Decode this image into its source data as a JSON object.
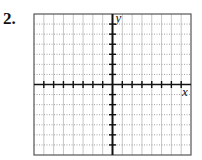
{
  "problem": {
    "number": "2."
  },
  "graph": {
    "x_label": "x",
    "y_label": "y",
    "columns": 16,
    "rows": 14,
    "origin_col": 8,
    "origin_row": 7,
    "x_range": [
      -8,
      8
    ],
    "y_range": [
      -7,
      7
    ],
    "grid_color": "#b9b9b9",
    "axis_color": "#111111",
    "border_color": "#555555"
  },
  "chart_data": {
    "type": "coordinate-grid",
    "title": "",
    "xlabel": "x",
    "ylabel": "y",
    "xlim": [
      -8,
      8
    ],
    "ylim": [
      -7,
      7
    ],
    "grid": true,
    "series": []
  }
}
